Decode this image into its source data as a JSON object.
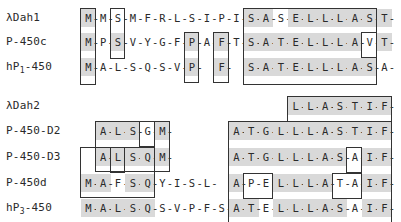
{
  "figure": {
    "type": "sequence_alignment",
    "blocks": [
      {
        "name": "block-1",
        "rows": [
          {
            "label": "λDah1",
            "label_sub": "",
            "label_rest": "",
            "residues": [
              "M",
              "M",
              "S",
              "M",
              "F",
              "R",
              "L",
              "S",
              "I",
              "P",
              "I",
              "S",
              "A",
              "S",
              "E",
              "L",
              "L",
              "L",
              "A",
              "S",
              "T"
            ]
          },
          {
            "label": "P-450c",
            "label_sub": "",
            "label_rest": "",
            "residues": [
              "M",
              "P",
              "S",
              "V",
              "Y",
              "G",
              "F",
              "P",
              "A",
              "F",
              "T",
              "S",
              "A",
              "T",
              "E",
              "L",
              "L",
              "L",
              "A",
              "V",
              "T"
            ]
          },
          {
            "label": "hP",
            "label_sub": "1",
            "label_rest": "-450",
            "residues": [
              "M",
              "A",
              "L",
              "S",
              "Q",
              "S",
              "V",
              "P",
              "",
              "F",
              "",
              "S",
              "A",
              "T",
              "E",
              "L",
              "L",
              "L",
              "A",
              "S",
              "A"
            ]
          }
        ]
      },
      {
        "name": "block-2",
        "rows": [
          {
            "label": "λDah2",
            "label_sub": "",
            "label_rest": "",
            "residues": [
              "",
              "",
              "",
              "",
              "",
              "",
              "",
              "",
              "",
              "",
              "",
              "",
              "",
              "",
              "L",
              "L",
              "A",
              "S",
              "T",
              "I",
              "F"
            ]
          },
          {
            "label": "P-450-D2",
            "label_sub": "",
            "label_rest": "",
            "residues": [
              "",
              "A",
              "L",
              "S",
              "G",
              "M",
              "",
              "",
              "",
              "",
              "A",
              "T",
              "G",
              "L",
              "L",
              "L",
              "A",
              "S",
              "T",
              "I",
              "F"
            ]
          },
          {
            "label": "P-450-D3",
            "label_sub": "",
            "label_rest": "",
            "residues": [
              "",
              "A",
              "L",
              "S",
              "Q",
              "M",
              "",
              "",
              "",
              "",
              "A",
              "T",
              "G",
              "L",
              "L",
              "L",
              "A",
              "S",
              "A",
              "I",
              "F"
            ]
          },
          {
            "label": "P-450d",
            "label_sub": "",
            "label_rest": "",
            "residues": [
              "M",
              "A",
              "F",
              "S",
              "Q",
              "Y",
              "I",
              "S",
              "L",
              "",
              "A",
              "P",
              "E",
              "L",
              "L",
              "L",
              "A",
              "T",
              "A",
              "I",
              "F"
            ]
          },
          {
            "label": "hP",
            "label_sub": "3",
            "label_rest": "-450",
            "residues": [
              "M",
              "A",
              "L",
              "S",
              "Q",
              "S",
              "V",
              "P",
              "F",
              "S",
              "A",
              "T",
              "E",
              "L",
              "L",
              "L",
              "A",
              "S",
              "A",
              "I",
              "F"
            ]
          }
        ]
      }
    ],
    "colors": {
      "shade": "#d9d9d9",
      "ink": "#2a2a2a",
      "border": "#333333"
    }
  }
}
